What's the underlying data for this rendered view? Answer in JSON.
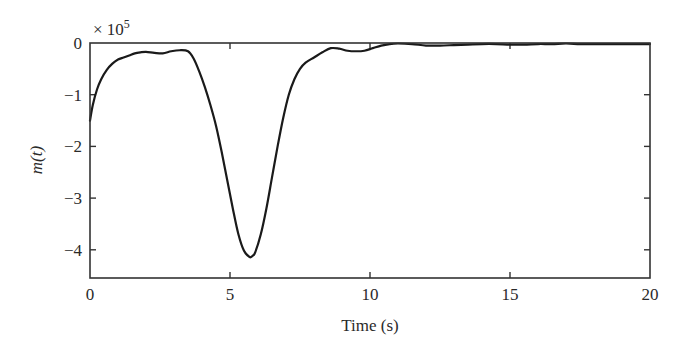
{
  "chart_data": {
    "type": "line",
    "title": "",
    "xlabel": "Time (s)",
    "ylabel": "m(t)",
    "y_multiplier_label": "× 10",
    "y_multiplier_exponent": "5",
    "xlim": [
      0,
      20
    ],
    "ylim": [
      -4.5,
      0
    ],
    "x_ticks": [
      0,
      5,
      10,
      15,
      20
    ],
    "x_tick_labels": [
      "0",
      "5",
      "10",
      "15",
      "20"
    ],
    "y_ticks": [
      0,
      -1,
      -2,
      -3,
      -4
    ],
    "y_tick_labels": [
      "0",
      "−1",
      "−2",
      "−3",
      "−4"
    ],
    "grid": false,
    "legend": null,
    "series": [
      {
        "name": "m(t)",
        "color": "#1a1a1a",
        "x": [
          0,
          0.1,
          0.25,
          0.4,
          0.6,
          0.8,
          1.0,
          1.2,
          1.4,
          1.6,
          1.8,
          2.0,
          2.3,
          2.6,
          2.9,
          3.2,
          3.5,
          3.7,
          3.9,
          4.1,
          4.3,
          4.5,
          4.7,
          4.9,
          5.1,
          5.3,
          5.5,
          5.7,
          5.8,
          5.9,
          6.1,
          6.3,
          6.5,
          6.7,
          6.9,
          7.1,
          7.3,
          7.5,
          7.7,
          8.0,
          8.3,
          8.6,
          8.9,
          9.2,
          9.5,
          9.8,
          10.1,
          10.4,
          10.7,
          11.0,
          11.5,
          12.0,
          12.5,
          13.0,
          13.5,
          14.0,
          14.5,
          15.0,
          15.5,
          16.0,
          16.5,
          17.0,
          17.5,
          18.0,
          18.5,
          19.0,
          19.5,
          20.0
        ],
        "y": [
          -1.5,
          -1.2,
          -0.9,
          -0.7,
          -0.52,
          -0.4,
          -0.32,
          -0.28,
          -0.24,
          -0.2,
          -0.18,
          -0.17,
          -0.19,
          -0.2,
          -0.16,
          -0.14,
          -0.16,
          -0.3,
          -0.55,
          -0.85,
          -1.2,
          -1.6,
          -2.1,
          -2.65,
          -3.2,
          -3.7,
          -4.02,
          -4.14,
          -4.12,
          -4.05,
          -3.7,
          -3.2,
          -2.6,
          -2.0,
          -1.45,
          -1.0,
          -0.7,
          -0.5,
          -0.38,
          -0.28,
          -0.18,
          -0.1,
          -0.11,
          -0.15,
          -0.16,
          -0.15,
          -0.1,
          -0.05,
          -0.02,
          -0.01,
          -0.02,
          -0.05,
          -0.05,
          -0.04,
          -0.03,
          -0.02,
          -0.02,
          -0.03,
          -0.03,
          -0.02,
          -0.02,
          -0.01,
          -0.02,
          -0.02,
          -0.02,
          -0.02,
          -0.02,
          -0.02
        ]
      }
    ]
  },
  "layout": {
    "plot_left": 90,
    "plot_right": 650,
    "plot_top": 43,
    "plot_bottom": 278,
    "y_zero_px": 43,
    "px_per_y_unit": 51.7
  }
}
